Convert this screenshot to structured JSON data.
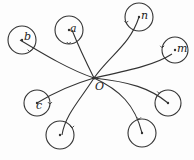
{
  "diagram": {
    "center": {
      "label": "O",
      "x": 94,
      "y": 78
    },
    "stroke_color": "#333333",
    "nodes": [
      {
        "label": "b",
        "cx": 22,
        "cy": 40,
        "r": 14,
        "lx": 24,
        "ly": 40,
        "path": "M94,78 C70,70 45,55 20,40"
      },
      {
        "label": "a",
        "cx": 69,
        "cy": 30,
        "r": 14,
        "lx": 70,
        "ly": 32,
        "path": "M94,78 C85,60 78,45 72,30"
      },
      {
        "label": "n",
        "cx": 139,
        "cy": 17,
        "r": 14,
        "lx": 141,
        "ly": 19,
        "path": "M94,78 C110,55 130,45 139,17"
      },
      {
        "label": "m",
        "cx": 175,
        "cy": 50,
        "r": 13,
        "lx": 177,
        "ly": 52,
        "path": "M94,78 C130,70 155,65 172,54"
      },
      {
        "label": "c",
        "cx": 37,
        "cy": 103,
        "r": 13,
        "lx": 36,
        "ly": 109,
        "path": "M94,78 C70,85 50,95 37,103"
      },
      {
        "label": "",
        "cx": 60,
        "cy": 135,
        "r": 14,
        "lx": 0,
        "ly": 0,
        "path": "M94,78 C80,100 65,115 62,135"
      },
      {
        "label": "",
        "cx": 142,
        "cy": 133,
        "r": 14,
        "lx": 0,
        "ly": 0,
        "path": "M94,78 C120,90 135,105 142,133"
      },
      {
        "label": "",
        "cx": 168,
        "cy": 103,
        "r": 13,
        "lx": 0,
        "ly": 0,
        "path": "M94,78 C130,82 150,88 168,103"
      }
    ]
  }
}
